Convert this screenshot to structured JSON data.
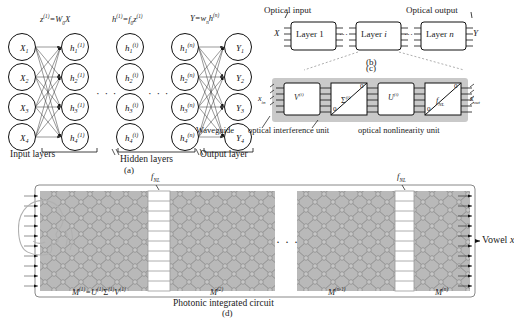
{
  "figure": {
    "panels": [
      "a",
      "b",
      "c",
      "d"
    ]
  },
  "panel_a": {
    "caption": "(a)",
    "equations": {
      "input_to_hidden": "z⁽¹⁾=W₀X",
      "activation": "h⁽¹⁾=f₀z⁽¹⁾",
      "output": "Y=wₙh⁽ⁿ⁾"
    },
    "equation_parts": {
      "eq1": {
        "lhs": "z",
        "lhs_sup": "(1)",
        "eq": "=",
        "rhs": "W",
        "rhs_sub": "0",
        "rhs_tail": "X"
      },
      "eq2": {
        "lhs": "h",
        "lhs_sup": "(1)",
        "eq": "=",
        "rhs": "f",
        "rhs_sub": "0",
        "rhs_tail": "z",
        "rhs_tail_sup": "(1)"
      },
      "eq3": {
        "lhs": "Y",
        "eq": "=",
        "rhs": "w",
        "rhs_sub": "n",
        "rhs_tail": "h",
        "rhs_tail_sup": "(n)"
      }
    },
    "input_nodes": [
      {
        "base": "X",
        "sub": "1",
        "sup": ""
      },
      {
        "base": "X",
        "sub": "2",
        "sup": ""
      },
      {
        "base": "X",
        "sub": "3",
        "sup": ""
      },
      {
        "base": "X",
        "sub": "4",
        "sup": ""
      }
    ],
    "hidden1_nodes": [
      {
        "base": "h",
        "sub": "1",
        "sup": "(1)"
      },
      {
        "base": "h",
        "sub": "2",
        "sup": "(1)"
      },
      {
        "base": "h",
        "sub": "3",
        "sup": "(1)"
      },
      {
        "base": "h",
        "sub": "4",
        "sup": "(1)"
      }
    ],
    "hiddeni_nodes": [
      {
        "base": "h",
        "sub": "1",
        "sup": "(i)"
      },
      {
        "base": "h",
        "sub": "2",
        "sup": "(i)"
      },
      {
        "base": "h",
        "sub": "3",
        "sup": "(i)"
      },
      {
        "base": "h",
        "sub": "4",
        "sup": "(i)"
      }
    ],
    "hiddenn_nodes": [
      {
        "base": "h",
        "sub": "1",
        "sup": "(n)"
      },
      {
        "base": "h",
        "sub": "2",
        "sup": "(n)"
      },
      {
        "base": "h",
        "sub": "3",
        "sup": "(n)"
      },
      {
        "base": "h",
        "sub": "4",
        "sup": "(n)"
      }
    ],
    "output_nodes": [
      {
        "base": "Y",
        "sub": "1",
        "sup": ""
      },
      {
        "base": "Y",
        "sub": "2",
        "sup": ""
      },
      {
        "base": "Y",
        "sub": "3",
        "sup": ""
      },
      {
        "base": "Y",
        "sub": "4",
        "sup": ""
      }
    ],
    "group_labels": {
      "input": "Input layers",
      "hidden": "Hidden layers",
      "output": "Output layer"
    },
    "ellipsis": "· · ·"
  },
  "panel_b": {
    "caption": "(b)",
    "input_header": "Optical input",
    "output_header": "Optical output",
    "input_symbol": "X",
    "output_symbol": "Y",
    "boxes": [
      {
        "label": "Layer 1",
        "name": "layer-1"
      },
      {
        "label": "Layer i",
        "name": "layer-i"
      },
      {
        "label": "Layer n",
        "name": "layer-n"
      }
    ],
    "ellipsis": "···"
  },
  "panel_c": {
    "caption": "(c)",
    "input_label": {
      "base": "x",
      "sub": "in"
    },
    "output_label": {
      "base": "x",
      "sub": "out"
    },
    "blocks": [
      {
        "type": "box",
        "base": "V",
        "sup": "(i)",
        "name": "v-matrix-block"
      },
      {
        "type": "triangle",
        "base": "Σ",
        "sup": "(i)",
        "name": "sigma-attenuator-block",
        "corner_values": [
          "0",
          "0"
        ]
      },
      {
        "type": "box",
        "base": "U",
        "sup": "(i)",
        "name": "u-matrix-block"
      },
      {
        "type": "triangle",
        "base": "f",
        "sub": "NL",
        "name": "nonlinearity-block",
        "corner_values": [
          "0",
          "0"
        ]
      }
    ],
    "annotations": {
      "waveguide": "Waveguide",
      "interference_unit": "optical interference unit",
      "nonlinearity_unit": "optical nonlinearity unit"
    }
  },
  "panel_d": {
    "caption": "(d)",
    "circuit_caption": "Photonic integrated circuit",
    "output_label": "Vowel x",
    "nonlinearity_labels": [
      {
        "base": "f",
        "sub": "NL"
      },
      {
        "base": "f",
        "sub": "NL"
      }
    ],
    "mesh_labels": [
      {
        "text": "M⁽¹⁾=U⁽¹⁾Σ⁽¹⁾V⁽¹⁾",
        "base": "M",
        "sup": "(1)",
        "name": "mesh-label-1"
      },
      {
        "text": "M⁽²⁾",
        "base": "M",
        "sup": "(2)",
        "name": "mesh-label-2"
      },
      {
        "text": "M⁽ⁿ⁻¹⁾",
        "base": "M",
        "sup": "(n-1)",
        "name": "mesh-label-n-1"
      },
      {
        "text": "M⁽ⁿ⁾",
        "base": "M",
        "sup": "(n)",
        "name": "mesh-label-n"
      }
    ],
    "ellipsis": "· · ·",
    "speaker_icon": "head-profile-icon"
  },
  "colors": {
    "ink": "#1a1a1a",
    "mesh_fill": "#b9b9b9",
    "mesh_line": "#8c8c8c",
    "panel_c_bg": "#c9c9c9",
    "faint": "#9a9a9a",
    "white": "#ffffff"
  }
}
